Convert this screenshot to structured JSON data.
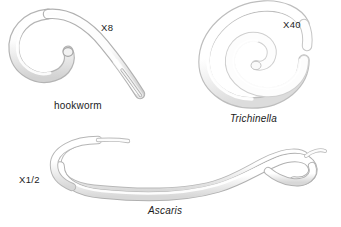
{
  "figure": {
    "background_color": "#ffffff",
    "body_fill_color": "#fbfbfb",
    "body_outline_color": "#9a9a9a",
    "body_shadow_color": "#c9c9c9",
    "label_color": "#1b1b1b",
    "width": 341,
    "height": 227
  },
  "specimens": [
    {
      "id": "hookworm",
      "name": "hookworm",
      "name_style": "plain",
      "magnification": "X8",
      "shape": "hook-curl"
    },
    {
      "id": "trichinella",
      "name": "Trichinella",
      "name_style": "italic",
      "magnification": "X40",
      "shape": "spiral-coil"
    },
    {
      "id": "ascaris",
      "name": "Ascaris",
      "name_style": "italic",
      "magnification": "X1/2",
      "shape": "elongated-s-curve"
    }
  ]
}
